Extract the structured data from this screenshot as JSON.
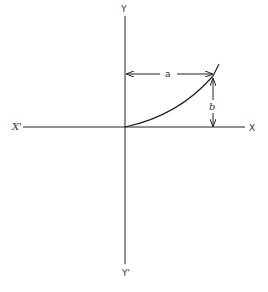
{
  "diagram": {
    "axes": {
      "y_top_label": "Y",
      "y_bottom_label": "Y'",
      "x_left_label": "X'",
      "x_right_label": "X"
    },
    "dimensions": {
      "horizontal_label": "a",
      "vertical_label": "b"
    },
    "colors": {
      "stroke": "#222222",
      "background": "#ffffff"
    }
  }
}
